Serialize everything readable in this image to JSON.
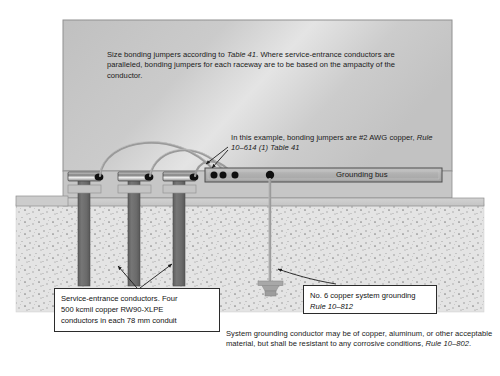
{
  "figure": {
    "type": "electrical-installation-diagram"
  },
  "wall_note": {
    "part1": "Size bonding jumpers according to ",
    "reference": "Table 41",
    "part2": ". Where service-entrance conductors are paralleled, bonding jumpers for each raceway are to be based on the ampacity of the conductor."
  },
  "jumper_note": {
    "part1": "In this example, bonding jumpers are #2 AWG copper, ",
    "reference": "Rule 10–614 (1) Table 41"
  },
  "bus": {
    "label": "Grounding bus"
  },
  "callouts": {
    "conductors": {
      "line1": "Service-entrance conductors. Four",
      "line2": "500 kcmil copper RW90-XLPE",
      "line3": "conductors in each 78 mm conduit"
    },
    "grounding": {
      "line1": "No. 6 copper system grounding",
      "reference": "Rule 10–812"
    }
  },
  "footer_note": {
    "part1": "System grounding conductor may be of copper, aluminum, or other acceptable material, but shall be resistant to any corrosive conditions, ",
    "reference": "Rule 10–802",
    "part2": "."
  },
  "colors": {
    "wall_fill": "#c9c9c9",
    "wall_stroke": "#8e8e8e",
    "bus_fill": "#b3b3b3",
    "bus_stroke": "#4a4a4a",
    "conduit_fill": "#6f6f6f",
    "footing_fill": "#bdbdbd",
    "earth_fill": "#e2e2e2",
    "jumper_stroke": "#9a9a9a",
    "dot_fill": "#101010",
    "leader_stroke": "#1c1c1c",
    "slab_fill": "#cfcfcf"
  },
  "elements": {
    "raceways": [
      "raceway-1",
      "raceway-2",
      "raceway-3"
    ],
    "bonding_jumper_count": 3,
    "bus_terminal_dots": 4,
    "ground_electrode": "ground-plate-clamp"
  }
}
